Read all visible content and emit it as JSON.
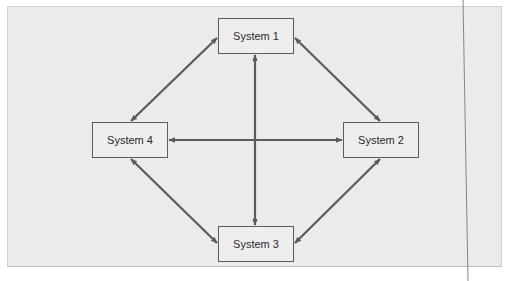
{
  "diagram": {
    "nodes": [
      {
        "id": "1",
        "label": "System 1"
      },
      {
        "id": "2",
        "label": "System 2"
      },
      {
        "id": "3",
        "label": "System 3"
      },
      {
        "id": "4",
        "label": "System 4"
      }
    ],
    "edges": [
      {
        "from": "System 1",
        "to": "System 2",
        "direction": "bidirectional"
      },
      {
        "from": "System 2",
        "to": "System 3",
        "direction": "bidirectional"
      },
      {
        "from": "System 3",
        "to": "System 4",
        "direction": "bidirectional"
      },
      {
        "from": "System 4",
        "to": "System 1",
        "direction": "bidirectional"
      },
      {
        "from": "System 1",
        "to": "System 3",
        "direction": "bidirectional"
      },
      {
        "from": "System 4",
        "to": "System 2",
        "direction": "bidirectional"
      }
    ],
    "colors": {
      "panel_background": "#ebebeb",
      "node_fill": "#eeeeee",
      "node_border": "#5c5c5c",
      "arrow": "#5a5a5a",
      "text": "#2a2a2a"
    }
  }
}
